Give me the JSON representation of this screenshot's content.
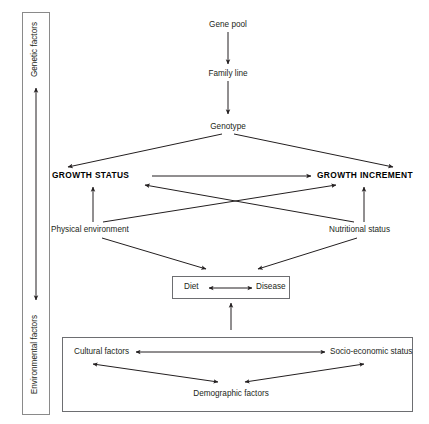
{
  "diagram": {
    "stroke_color": "#231f20",
    "box_stroke_color": "#6d6e71",
    "background": "#ffffff"
  },
  "axis": {
    "top_label": "Genetic factors",
    "bottom_label": "Environmental factors",
    "arrow_type": "double-headed-vertical"
  },
  "nodes": {
    "gene_pool": "Gene pool",
    "family_line": "Family line",
    "genotype": "Genotype",
    "growth_status": "GROWTH STATUS",
    "growth_increment": "GROWTH INCREMENT",
    "physical_environment": "Physical environment",
    "nutritional_status": "Nutritional status",
    "diet": "Diet",
    "disease": "Disease",
    "cultural_factors": "Cultural factors",
    "socio_economic_status": "Socio-economic status",
    "demographic_factors": "Demographic factors"
  },
  "edges": [
    {
      "from": "Gene pool",
      "to": "Family line",
      "type": "single"
    },
    {
      "from": "Family line",
      "to": "Genotype",
      "type": "single"
    },
    {
      "from": "Genotype",
      "to": "GROWTH STATUS",
      "type": "single"
    },
    {
      "from": "Genotype",
      "to": "GROWTH INCREMENT",
      "type": "single"
    },
    {
      "from": "GROWTH STATUS",
      "to": "GROWTH INCREMENT",
      "type": "single"
    },
    {
      "from": "Physical environment",
      "to": "GROWTH STATUS",
      "type": "single"
    },
    {
      "from": "Physical environment",
      "to": "GROWTH INCREMENT",
      "type": "single"
    },
    {
      "from": "Nutritional status",
      "to": "GROWTH INCREMENT",
      "type": "single"
    },
    {
      "from": "Nutritional status",
      "to": "GROWTH STATUS",
      "type": "single"
    },
    {
      "from": "Physical environment",
      "to": "Diet",
      "type": "single"
    },
    {
      "from": "Nutritional status",
      "to": "Disease",
      "type": "single"
    },
    {
      "from": "Diet",
      "to": "Disease",
      "type": "double"
    },
    {
      "from": "Demographic factors",
      "to": "Diet",
      "type": "single"
    },
    {
      "from": "Cultural factors",
      "to": "Socio-economic status",
      "type": "double"
    },
    {
      "from": "Cultural factors",
      "to": "Demographic factors",
      "type": "double"
    },
    {
      "from": "Socio-economic status",
      "to": "Demographic factors",
      "type": "double"
    }
  ]
}
